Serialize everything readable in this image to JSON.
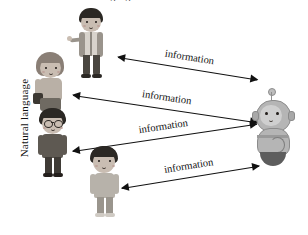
{
  "figure": {
    "clipped_title": "Natural Language Interaction",
    "axis_label": "Natural language",
    "background_color": "#ffffff"
  },
  "arrows": [
    {
      "label": "information",
      "direction": "bidirectional"
    },
    {
      "label": "information",
      "direction": "bidirectional"
    },
    {
      "label": "information",
      "direction": "bidirectional"
    },
    {
      "label": "information",
      "direction": "bidirectional"
    }
  ],
  "actors": {
    "humans": [
      {
        "name": "person-pointing",
        "description": "man with dark hair and striped shirt, arm extended"
      },
      {
        "name": "person-with-bag",
        "description": "woman with bob haircut holding a dark bag"
      },
      {
        "name": "person-with-glasses",
        "description": "person wearing glasses in dark clothing"
      },
      {
        "name": "child",
        "description": "child with bowl-cut hair in light gray shirt"
      }
    ],
    "robot": {
      "name": "robot",
      "description": "gray robot with antenna and rounded base"
    }
  }
}
